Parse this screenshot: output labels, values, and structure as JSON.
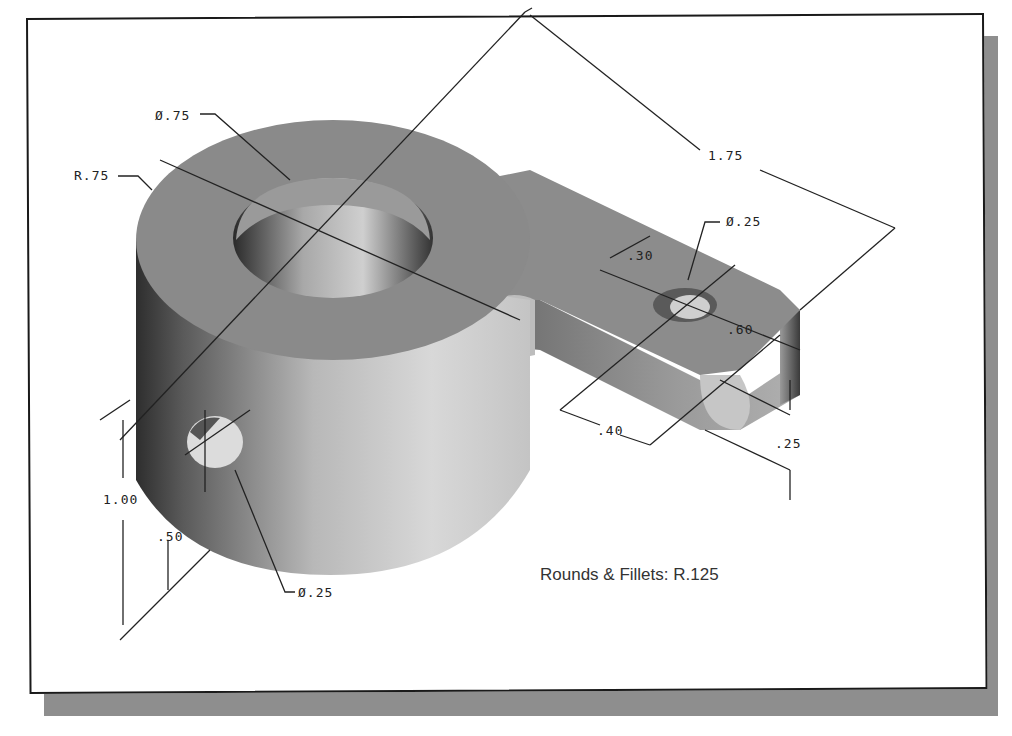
{
  "figure": {
    "type": "isometric technical drawing",
    "note": "Rounds & Fillets: R.125",
    "colors": {
      "frame_border": "#1a1a1a",
      "shadow": "#8e8e8e",
      "part_top": "#8a8a8a",
      "part_side_light": "#d0d0d0",
      "part_side_dark": "#3a3a3a",
      "dimension_line": "#222222"
    }
  },
  "dimensions": {
    "bore_diameter": "Ø.75",
    "boss_radius": "R.75",
    "arm_length": "1.75",
    "arm_hole_diameter": "Ø.25",
    "arm_hole_offset": ".30",
    "arm_width": ".60",
    "arm_hole_from_end": ".40",
    "arm_thickness": ".25",
    "boss_height": "1.00",
    "side_hole_height": ".50",
    "side_hole_diameter": "Ø.25"
  }
}
